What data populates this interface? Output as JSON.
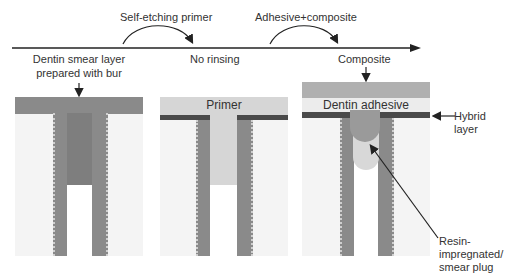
{
  "timeline": {
    "step1_label": "Self-etching primer",
    "step2_label": "Adhesive+composite"
  },
  "panels": [
    {
      "caption_line1": "Dentin smear layer",
      "caption_line2": "prepared with bur",
      "layer_label": ""
    },
    {
      "caption_line1": "No rinsing",
      "layer_label": "Primer"
    },
    {
      "caption_line1": "Composite",
      "layer_label": "Dentin adhesive"
    }
  ],
  "annotations": {
    "hybrid_line1": "Hybrid",
    "hybrid_line2": "layer",
    "plug_line1": "Resin-",
    "plug_line2": "impregnated/",
    "plug_line3": "smear plug"
  },
  "colors": {
    "smear": "#8a8a8a",
    "primer": "#d6d6d6",
    "hybrid": "#4a4a4a",
    "composite": "#b0b0b0",
    "adhesive": "#ececec",
    "background": "#f4f4f4"
  }
}
